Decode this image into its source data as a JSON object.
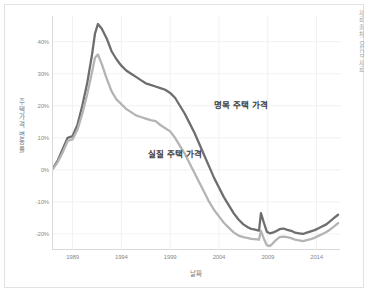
{
  "source_note": "자료 출처: OECD 자료",
  "chart_data": {
    "type": "line",
    "title": "",
    "xlabel": "날짜",
    "ylabel": "주택가격 변동률",
    "grid": true,
    "legend_position": "inline-annotation",
    "xlim": [
      1987.0,
      2016.5
    ],
    "ylim": [
      -25,
      48
    ],
    "xticks": [
      1989,
      1994,
      1999,
      2004,
      2009,
      2014
    ],
    "xtick_labels": [
      "1989",
      "1994",
      "1999",
      "2004",
      "2009",
      "2014"
    ],
    "yticks": [
      40,
      30,
      20,
      10,
      0,
      -10,
      -20
    ],
    "ytick_labels": [
      "40%",
      "30%",
      "20%",
      "10%",
      "0%",
      "-10%",
      "-20%"
    ],
    "series": [
      {
        "name": "명목 주택 가격",
        "color": "#6e6e6e",
        "label_x": 1999.2,
        "label_y": 22.0,
        "x": [
          1987.0,
          1987.5,
          1988.0,
          1988.5,
          1989.0,
          1989.5,
          1990.0,
          1990.5,
          1991.0,
          1991.3,
          1991.6,
          1992.0,
          1992.5,
          1993.0,
          1993.5,
          1994.0,
          1994.5,
          1995.0,
          1995.5,
          1996.0,
          1996.5,
          1997.0,
          1997.5,
          1998.0,
          1998.5,
          1999.0,
          1999.5,
          2000.0,
          2000.5,
          2001.0,
          2001.5,
          2002.0,
          2002.5,
          2003.0,
          2003.5,
          2004.0,
          2004.5,
          2005.0,
          2005.5,
          2006.0,
          2006.5,
          2007.0,
          2007.3,
          2007.6,
          2007.9,
          2008.1,
          2008.3,
          2008.6,
          2008.9,
          2009.2,
          2009.5,
          2009.8,
          2010.2,
          2010.6,
          2011.0,
          2011.4,
          2011.8,
          2012.2,
          2012.6,
          2013.0,
          2013.4,
          2013.8,
          2014.2,
          2014.6,
          2015.0,
          2015.4,
          2015.8,
          2016.2
        ],
        "y": [
          0.5,
          3.0,
          6.5,
          10.0,
          10.5,
          14.0,
          20.0,
          27.0,
          36.0,
          42.5,
          45.5,
          44.0,
          41.0,
          37.0,
          34.5,
          32.5,
          31.0,
          30.0,
          29.0,
          28.0,
          27.0,
          26.5,
          26.0,
          25.5,
          25.0,
          24.0,
          22.5,
          20.0,
          17.5,
          14.5,
          11.5,
          8.0,
          4.5,
          1.0,
          -2.5,
          -5.5,
          -8.5,
          -11.0,
          -13.5,
          -15.5,
          -17.0,
          -18.0,
          -18.4,
          -18.6,
          -18.8,
          -19.0,
          -13.5,
          -16.5,
          -19.3,
          -19.8,
          -19.6,
          -19.2,
          -18.5,
          -18.3,
          -18.7,
          -19.0,
          -19.6,
          -19.8,
          -20.0,
          -19.6,
          -19.2,
          -18.8,
          -18.2,
          -17.6,
          -17.0,
          -16.0,
          -15.0,
          -14.0
        ]
      },
      {
        "name": "실질 주택 가격",
        "color": "#b4b4b4",
        "label_x": 1993.0,
        "label_y": 6.5,
        "x": [
          1987.0,
          1987.5,
          1988.0,
          1988.5,
          1989.0,
          1989.5,
          1990.0,
          1990.5,
          1991.0,
          1991.3,
          1991.6,
          1992.0,
          1992.5,
          1993.0,
          1993.5,
          1994.0,
          1994.5,
          1995.0,
          1995.5,
          1996.0,
          1996.5,
          1997.0,
          1997.5,
          1998.0,
          1998.5,
          1999.0,
          1999.5,
          2000.0,
          2000.5,
          2001.0,
          2001.5,
          2002.0,
          2002.5,
          2003.0,
          2003.5,
          2004.0,
          2004.5,
          2005.0,
          2005.5,
          2006.0,
          2006.5,
          2007.0,
          2007.3,
          2007.6,
          2007.9,
          2008.1,
          2008.3,
          2008.6,
          2008.9,
          2009.2,
          2009.5,
          2009.8,
          2010.2,
          2010.6,
          2011.0,
          2011.4,
          2011.8,
          2012.2,
          2012.6,
          2013.0,
          2013.4,
          2013.8,
          2014.2,
          2014.6,
          2015.0,
          2015.4,
          2015.8,
          2016.2
        ],
        "y": [
          0.3,
          2.5,
          5.5,
          9.0,
          9.5,
          12.5,
          17.5,
          23.5,
          30.5,
          35.0,
          36.0,
          33.0,
          28.5,
          24.5,
          22.0,
          20.5,
          19.0,
          18.0,
          17.0,
          16.5,
          16.0,
          15.5,
          15.2,
          14.0,
          13.0,
          12.0,
          10.0,
          7.5,
          5.0,
          2.0,
          -1.0,
          -4.0,
          -7.0,
          -10.0,
          -12.5,
          -14.5,
          -16.5,
          -18.0,
          -19.5,
          -20.5,
          -21.0,
          -21.3,
          -21.5,
          -21.6,
          -21.7,
          -21.8,
          -19.0,
          -21.5,
          -23.5,
          -23.8,
          -23.0,
          -22.0,
          -21.0,
          -20.8,
          -21.0,
          -21.3,
          -21.8,
          -22.0,
          -22.2,
          -21.9,
          -21.6,
          -21.2,
          -20.6,
          -20.0,
          -19.4,
          -18.6,
          -17.6,
          -16.6
        ]
      }
    ]
  }
}
